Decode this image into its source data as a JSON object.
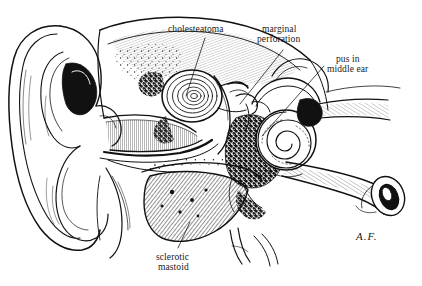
{
  "figure": {
    "background_color": "#ffffff",
    "ink_color": "#111111",
    "width": 422,
    "height": 286
  },
  "labels": [
    {
      "id": "cholesteatoma",
      "text": "cholesteatoma",
      "x": 168,
      "y": 24,
      "leader": "from label down-left to concentric lamellar mass in attic"
    },
    {
      "id": "marginal-perforation",
      "line1": "marginal",
      "line2": "perforation",
      "x": 262,
      "y": 24,
      "leader": "from label down-left to tympanic membrane margin"
    },
    {
      "id": "pus-in-middle-ear",
      "line1": "pus in",
      "line2": "middle ear",
      "x": 327,
      "y": 54,
      "leader": "from label down-left to dark stippled middle-ear cavity"
    },
    {
      "id": "sclerotic-mastoid",
      "line1": "sclerotic",
      "line2": "mastoid",
      "x": 156,
      "y": 252,
      "leader": "from label up to densely hatched mastoid bone"
    }
  ],
  "signature": {
    "text": "A.F.",
    "x": 356,
    "y": 230
  },
  "anatomy": [
    {
      "name": "auricle-pinna",
      "description": "outer ear cartilage at left"
    },
    {
      "name": "external-auditory-canal",
      "description": "canal running medially from concha"
    },
    {
      "name": "tympanic-membrane",
      "description": "eardrum with marginal perforation"
    },
    {
      "name": "cholesteatoma-mass",
      "description": "concentric onion-skin keratin mass in attic"
    },
    {
      "name": "middle-ear-cavity",
      "description": "cavity filled with pus, shown stippled black"
    },
    {
      "name": "cochlea",
      "description": "spiral cochlea"
    },
    {
      "name": "semicircular-canals",
      "description": "looped canals above cochlea"
    },
    {
      "name": "mastoid-bone",
      "description": "sclerotic mastoid with dense diagonal hatching"
    },
    {
      "name": "eustachian-tube",
      "description": "tube extending to lower right with pharyngeal opening"
    },
    {
      "name": "internal-auditory-meatus",
      "description": "nerve bundle entering from upper right"
    },
    {
      "name": "mandibular-condyle",
      "description": "joint structure below canal"
    }
  ],
  "caption_cut": " "
}
